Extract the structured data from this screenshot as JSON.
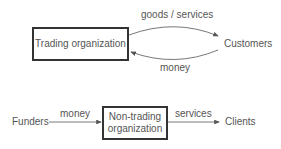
{
  "top_diagram": {
    "organization": "Trading organization",
    "party": "Customers",
    "flow_out_label": "goods / services",
    "flow_in_label": "money"
  },
  "bottom_diagram": {
    "source": "Funders",
    "source_flow_label": "money",
    "organization_line1": "Non-trading",
    "organization_line2": "organization",
    "output_flow_label": "services",
    "target": "Clients"
  },
  "colors": {
    "box_border": "#333333",
    "text": "#555555",
    "arrow": "#555555"
  }
}
